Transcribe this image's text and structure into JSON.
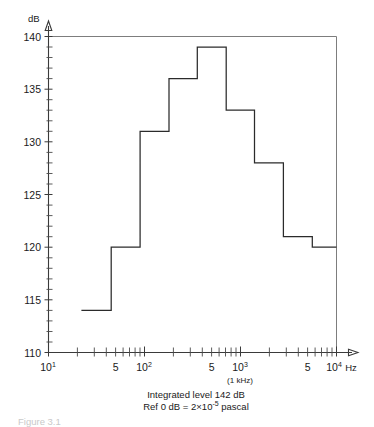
{
  "figure": {
    "y_axis_unit": "dB",
    "x_axis_unit": "Hz",
    "khz_note": "(1 kHz)",
    "caption_line1": "Integrated level 142 dB",
    "caption_line2_prefix": "Ref  0 dB = 2×10",
    "caption_line2_exp": "-5",
    "caption_line2_suffix": "pascal",
    "figure_number_partial": "Figure 3.1",
    "ink_color": "#2b2b2b",
    "frame_color": "#7d7d7d",
    "background": "#ffffff"
  },
  "chart_data": {
    "type": "bar",
    "title": "",
    "subtitle": "Integrated level 142 dB",
    "xlabel": "Hz",
    "ylabel": "dB",
    "xscale": "log",
    "xlim": [
      10,
      10000
    ],
    "ylim": [
      110,
      140
    ],
    "grid": false,
    "legend": null,
    "y_ticks": [
      110,
      115,
      120,
      125,
      130,
      135,
      140
    ],
    "y_tick_labels": [
      "110",
      "115",
      "120",
      "125",
      "130",
      "135",
      "140"
    ],
    "y_minor_tick_step": 1,
    "x_decade_ticks": [
      10,
      100,
      1000,
      10000
    ],
    "x_decade_labels": [
      "10¹",
      "10²",
      "10³",
      "10⁴"
    ],
    "x_mid_ticks": [
      50,
      500,
      5000
    ],
    "x_mid_labels": [
      "5",
      "5",
      "5"
    ],
    "bar_style": "staircase-step-outline",
    "band_type": "octave",
    "categories": [
      "31.5",
      "63",
      "125",
      "250",
      "500",
      "1000",
      "2000",
      "4000",
      "8000"
    ],
    "category_labels_hz": [
      "31.5 Hz",
      "63 Hz",
      "125 Hz",
      "250 Hz",
      "500 Hz",
      "1 kHz",
      "2 kHz",
      "4 kHz",
      "8 kHz"
    ],
    "band_edges_hz": [
      22,
      45,
      90,
      180,
      355,
      710,
      1400,
      2800,
      5600,
      11200
    ],
    "values": [
      114,
      120,
      131,
      136,
      139,
      133,
      128,
      121,
      120
    ],
    "units": "dB re 2×10⁻⁵ Pa",
    "annotations": [
      "Integrated level 142 dB",
      "Ref  0 dB = 2×10⁻⁵ pascal",
      "(1 kHz)"
    ]
  }
}
